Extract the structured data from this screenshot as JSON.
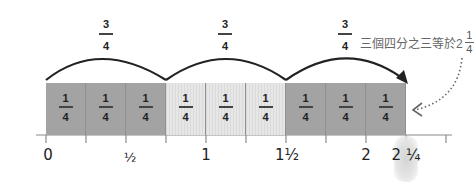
{
  "annotation": {
    "text": "三個四分之三等於2",
    "fraction_numerator": "1",
    "fraction_denominator": "4"
  },
  "jumps": [
    {
      "numerator": "3",
      "denominator": "4",
      "from": 0,
      "to": 0.75
    },
    {
      "numerator": "3",
      "denominator": "4",
      "from": 0.75,
      "to": 1.5
    },
    {
      "numerator": "3",
      "denominator": "4",
      "from": 1.5,
      "to": 2.25
    }
  ],
  "boxes": [
    {
      "numerator": "1",
      "denominator": "4",
      "shade": "dark"
    },
    {
      "numerator": "1",
      "denominator": "4",
      "shade": "dark"
    },
    {
      "numerator": "1",
      "denominator": "4",
      "shade": "dark"
    },
    {
      "numerator": "1",
      "denominator": "4",
      "shade": "light"
    },
    {
      "numerator": "1",
      "denominator": "4",
      "shade": "light"
    },
    {
      "numerator": "1",
      "denominator": "4",
      "shade": "light"
    },
    {
      "numerator": "1",
      "denominator": "4",
      "shade": "dark"
    },
    {
      "numerator": "1",
      "denominator": "4",
      "shade": "dark"
    },
    {
      "numerator": "1",
      "denominator": "4",
      "shade": "dark"
    }
  ],
  "axis": {
    "labels": [
      {
        "text": "0",
        "value": 0
      },
      {
        "text": "½",
        "value": 0.5
      },
      {
        "text": "1",
        "value": 1
      },
      {
        "text": "1½",
        "value": 1.5
      },
      {
        "text": "2",
        "value": 2
      },
      {
        "text": "2 ¼",
        "value": 2.25
      }
    ],
    "tick_step": "1/4",
    "range": [
      0,
      2.5
    ]
  },
  "colors": {
    "dark_box": "#a3a3a3",
    "light_box": "#e6e6e6",
    "arc": "#222222",
    "highlight": "#d4d4d4"
  }
}
